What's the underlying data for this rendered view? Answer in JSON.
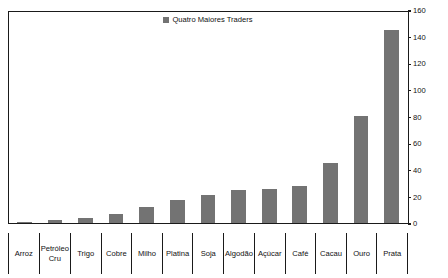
{
  "chart_data": {
    "type": "bar",
    "title": "",
    "subtitle": "",
    "xlabel": "",
    "ylabel": "",
    "ylim": [
      0,
      160
    ],
    "ytick_interval": 20,
    "yticks": [
      0,
      20,
      40,
      60,
      80,
      100,
      120,
      140,
      160
    ],
    "ytick_labels": [
      "0",
      "20",
      "40",
      "60",
      "80",
      "100",
      "120",
      "140",
      "160"
    ],
    "grid": false,
    "legend_position": "top-center",
    "legend": [
      "Quatro Maiores Traders"
    ],
    "bar_color": "#737373",
    "axis_color": "#1a1a1a",
    "background_color": "#ffffff",
    "categories": [
      "Arroz",
      "Petróleo\nCru",
      "Trigo",
      "Cobre",
      "Milho",
      "Platina",
      "Soja",
      "Algodão",
      "Açúcar",
      "Café",
      "Cacau",
      "Ouro",
      "Prata"
    ],
    "series": [
      {
        "name": "Quatro Maiores Traders",
        "values": [
          1,
          2,
          4,
          7,
          12,
          17,
          21,
          25,
          26,
          28,
          45,
          81,
          146
        ]
      }
    ]
  }
}
